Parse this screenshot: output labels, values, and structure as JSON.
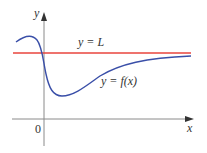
{
  "diagram": {
    "type": "function-graph",
    "axes": {
      "x_label": "x",
      "y_label": "y",
      "origin_label": "0"
    },
    "curves": [
      {
        "name": "asymptote",
        "label": "y = L",
        "color": "#e8453c"
      },
      {
        "name": "function",
        "label": "y = f(x)",
        "color": "#3a4fa8"
      }
    ],
    "colors": {
      "axis": "#8a8a8a",
      "text": "#333333"
    }
  }
}
